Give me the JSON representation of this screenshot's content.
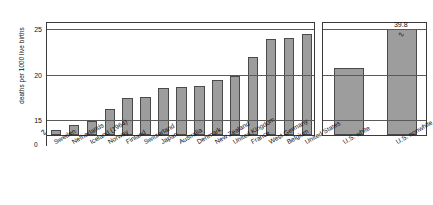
{
  "chart_data": {
    "type": "bar",
    "title": "",
    "xlabel": "",
    "ylabel": "deaths per 1000 live births",
    "ylim": [
      13.3,
      25.8
    ],
    "yticks": [
      15,
      20,
      25
    ],
    "ytick_labels": [
      "15",
      "20",
      "25"
    ],
    "zero_label": "0",
    "axis_broken": true,
    "grid": true,
    "legend": "none",
    "panels": [
      {
        "name": "countries",
        "categories": [
          "Sweden",
          "Netherlands",
          "Iceland (1964)",
          "Norway",
          "Finland",
          "Switzerland",
          "Japan",
          "Australia",
          "Denmark",
          "New Zealand",
          "United Kingdom",
          "France",
          "West Germany",
          "Belgium",
          "United States"
        ],
        "values": [
          13.9,
          14.4,
          14.8,
          16.2,
          17.4,
          17.5,
          18.5,
          18.6,
          18.7,
          19.3,
          19.8,
          21.9,
          23.8,
          23.9,
          24.4
        ]
      },
      {
        "name": "us-breakdown",
        "categories": [
          "U.S. white",
          "U.S. nonwhite"
        ],
        "values": [
          20.6,
          39.8
        ],
        "labels": [
          "",
          "39.8"
        ],
        "clipped": [
          false,
          true
        ]
      }
    ]
  },
  "chart": {
    "bar_color": "#9d9d9d",
    "bar_stroke": "#4a4a4a",
    "frame_color": "#3a3a3a",
    "grid_color": "#5a5a5a",
    "break_glyph": "∿",
    "axis_break_glyph": "∿"
  }
}
